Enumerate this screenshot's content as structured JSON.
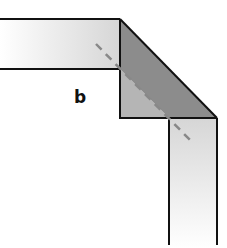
{
  "diagram": {
    "label": "b",
    "colors": {
      "band_light": "#f2f2f2",
      "band_mid": "#d9d9d9",
      "fold_dark": "#8c8c8c",
      "fold_under": "#b5b5b5",
      "outline": "#111111",
      "crease_dash": "#888888"
    }
  }
}
